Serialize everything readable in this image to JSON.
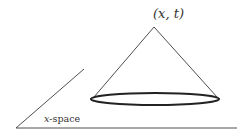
{
  "diagram": {
    "apex_label": "(x, t)",
    "space_label_var": "x",
    "space_label_rest": "-space",
    "colors": {
      "line": "#3a3a3a",
      "ellipse": "#222222",
      "background": "#ffffff"
    }
  }
}
